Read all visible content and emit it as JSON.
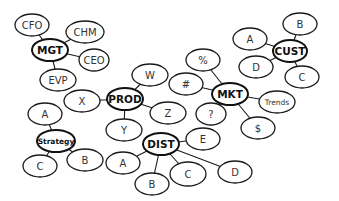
{
  "diagram": {
    "type": "mind-map",
    "clusters": [
      {
        "hub": {
          "id": "mgt",
          "label": "MGT",
          "x": 50,
          "y": 50,
          "rx": 18,
          "ry": 11
        },
        "leaves": [
          {
            "id": "mgt-cfo",
            "label": "CFO",
            "x": 32,
            "y": 25,
            "rx": 17,
            "ry": 11
          },
          {
            "id": "mgt-chm",
            "label": "CHM",
            "x": 85,
            "y": 32,
            "rx": 19,
            "ry": 11
          },
          {
            "id": "mgt-ceo",
            "label": "CEO",
            "x": 94,
            "y": 60,
            "rx": 15,
            "ry": 11
          },
          {
            "id": "mgt-evp",
            "label": "EVP",
            "x": 58,
            "y": 80,
            "rx": 18,
            "ry": 11
          }
        ]
      },
      {
        "hub": {
          "id": "prod",
          "label": "PROD",
          "x": 125,
          "y": 99,
          "rx": 18,
          "ry": 11
        },
        "leaves": [
          {
            "id": "prod-w",
            "label": "W",
            "x": 150,
            "y": 75,
            "rx": 18,
            "ry": 11
          },
          {
            "id": "prod-x",
            "label": "X",
            "x": 82,
            "y": 101,
            "rx": 18,
            "ry": 11
          },
          {
            "id": "prod-z",
            "label": "Z",
            "x": 168,
            "y": 113,
            "rx": 18,
            "ry": 11
          },
          {
            "id": "prod-y",
            "label": "Y",
            "x": 124,
            "y": 130,
            "rx": 18,
            "ry": 11
          }
        ]
      },
      {
        "hub": {
          "id": "mkt",
          "label": "MKT",
          "x": 230,
          "y": 94,
          "rx": 18,
          "ry": 11
        },
        "leaves": [
          {
            "id": "mkt-percent",
            "label": "%",
            "x": 203,
            "y": 60,
            "rx": 17,
            "ry": 11
          },
          {
            "id": "mkt-hash",
            "label": "#",
            "x": 186,
            "y": 84,
            "rx": 17,
            "ry": 11
          },
          {
            "id": "mkt-question",
            "label": "?",
            "x": 211,
            "y": 114,
            "rx": 15,
            "ry": 11
          },
          {
            "id": "mkt-dollar",
            "label": "$",
            "x": 258,
            "y": 128,
            "rx": 17,
            "ry": 11
          },
          {
            "id": "mkt-trends",
            "label": "Trends",
            "x": 277,
            "y": 102,
            "rx": 18,
            "ry": 11,
            "small": true
          }
        ]
      },
      {
        "hub": {
          "id": "cust",
          "label": "CUST",
          "x": 290,
          "y": 51,
          "rx": 17,
          "ry": 11
        },
        "leaves": [
          {
            "id": "cust-b",
            "label": "B",
            "x": 300,
            "y": 24,
            "rx": 17,
            "ry": 11
          },
          {
            "id": "cust-a",
            "label": "A",
            "x": 250,
            "y": 39,
            "rx": 17,
            "ry": 11
          },
          {
            "id": "cust-d",
            "label": "D",
            "x": 256,
            "y": 67,
            "rx": 17,
            "ry": 11
          },
          {
            "id": "cust-c",
            "label": "C",
            "x": 302,
            "y": 77,
            "rx": 17,
            "ry": 11
          }
        ]
      },
      {
        "hub": {
          "id": "strategy",
          "label": "Strategy",
          "x": 56,
          "y": 141,
          "rx": 19,
          "ry": 11,
          "small": true
        },
        "leaves": [
          {
            "id": "strategy-a",
            "label": "A",
            "x": 45,
            "y": 114,
            "rx": 17,
            "ry": 11
          },
          {
            "id": "strategy-c",
            "label": "C",
            "x": 40,
            "y": 166,
            "rx": 17,
            "ry": 11
          },
          {
            "id": "strategy-b",
            "label": "B",
            "x": 85,
            "y": 160,
            "rx": 18,
            "ry": 11
          }
        ]
      },
      {
        "hub": {
          "id": "dist",
          "label": "DIST",
          "x": 161,
          "y": 144,
          "rx": 18,
          "ry": 11
        },
        "leaves": [
          {
            "id": "dist-e",
            "label": "E",
            "x": 203,
            "y": 139,
            "rx": 17,
            "ry": 11
          },
          {
            "id": "dist-a",
            "label": "A",
            "x": 123,
            "y": 163,
            "rx": 17,
            "ry": 11
          },
          {
            "id": "dist-b",
            "label": "B",
            "x": 152,
            "y": 184,
            "rx": 17,
            "ry": 11
          },
          {
            "id": "dist-c",
            "label": "C",
            "x": 188,
            "y": 174,
            "rx": 18,
            "ry": 12
          },
          {
            "id": "dist-d",
            "label": "D",
            "x": 235,
            "y": 172,
            "rx": 17,
            "ry": 11
          }
        ]
      }
    ],
    "colors": {
      "stroke": "#1a1a1a",
      "fill": "#ffffff",
      "text": "#333333"
    }
  }
}
